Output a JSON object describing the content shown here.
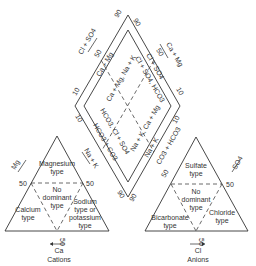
{
  "diagram": {
    "type": "piper-trilinear",
    "cation_triangle": {
      "caption": "Cations",
      "axis_labels": {
        "left": "Mg",
        "right": "Na + K",
        "bottom": "Ca"
      },
      "ticks": {
        "left": "50",
        "right": "50",
        "bottom": "50"
      },
      "zones": [
        {
          "line1": "Magnesium",
          "line2": "type"
        },
        {
          "line1": "No",
          "line2": "dominant",
          "line3": "type"
        },
        {
          "line1": "Calcium",
          "line2": "type"
        },
        {
          "line1": "Sodium",
          "line2": "type or",
          "line3": "potassium",
          "line4": "type"
        }
      ]
    },
    "anion_triangle": {
      "caption": "Anions",
      "axis_labels": {
        "left": "CO3 + HCO3",
        "right": "SO4",
        "bottom": "Cl"
      },
      "ticks": {
        "left": "50",
        "right": "50",
        "bottom": "50"
      },
      "zones": [
        {
          "line1": "Sulfate",
          "line2": "type"
        },
        {
          "line1": "No",
          "line2": "dominant",
          "line3": "type"
        },
        {
          "line1": "Bicarbonate",
          "line2": "type"
        },
        {
          "line1": "Chloride",
          "line2": "type"
        }
      ]
    },
    "diamond": {
      "axis_labels": {
        "upper_left": "Cl + SO4",
        "upper_right": "Ca + Mg"
      },
      "ticks": {
        "top_left": "90",
        "top_right": "90",
        "left_upper": "10",
        "right_upper": "10",
        "left_lower": "10",
        "right_lower": "10",
        "bottom_left": "90",
        "bottom_right": "90",
        "upper_left_50": "50",
        "upper_right_50": "50"
      },
      "inner_labels": {
        "ul_edge": "Ca + Mg",
        "ur_edge": "Cl + SO4",
        "ll_edge": "HCO3 + CO3",
        "lr_edge": "Na + K",
        "diag1": "Ca + Mg, Na + K",
        "diag2": "Cl + SO4, HCO3",
        "diag3": "HCO3, Cl + SO4",
        "diag4": "Na + K, Ca + Mg"
      }
    }
  }
}
